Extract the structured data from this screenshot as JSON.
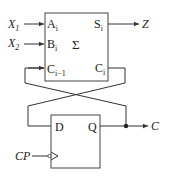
{
  "diagram": {
    "type": "sequential serial adder circuit",
    "adder": {
      "symbol": "Σ",
      "inputs": [
        {
          "pin": "A",
          "sub": "i",
          "signal": "X",
          "signal_sub": "1"
        },
        {
          "pin": "B",
          "sub": "i",
          "signal": "X",
          "signal_sub": "2"
        },
        {
          "pin": "C",
          "sub": "i−1"
        }
      ],
      "outputs": [
        {
          "pin": "S",
          "sub": "i",
          "signal": "Z"
        },
        {
          "pin": "C",
          "sub": "i"
        }
      ]
    },
    "flipflop": {
      "d_label": "D",
      "q_label": "Q",
      "clock_signal": "CP",
      "output_signal": "C"
    },
    "colors": {
      "line": "#333333",
      "background": "#ffffff"
    }
  }
}
